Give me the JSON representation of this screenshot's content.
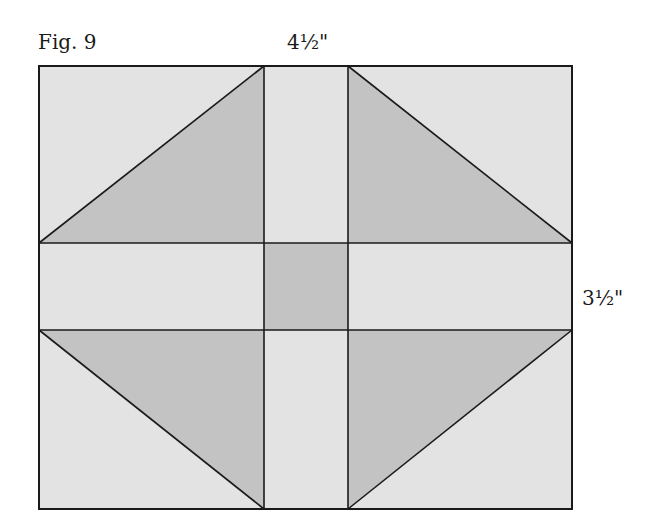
{
  "figure": {
    "label": "Fig. 9",
    "top_dimension": "4½\"",
    "side_dimension": "3½\""
  },
  "colors": {
    "light_fill": "#e3e3e3",
    "dark_fill": "#c3c3c3",
    "line": "#1a1a1a"
  },
  "block": {
    "outer": {
      "x1": 39,
      "y1": 66,
      "x2": 572,
      "y2": 509
    },
    "verticals": [
      264,
      348
    ],
    "horizontals": [
      243,
      330
    ],
    "pieces": [
      {
        "name": "top-left-corner",
        "triangle": "lower-right dark"
      },
      {
        "name": "top-center-bar",
        "fill": "light"
      },
      {
        "name": "top-right-corner",
        "triangle": "lower-left dark"
      },
      {
        "name": "middle-left-bar",
        "fill": "light"
      },
      {
        "name": "center-square",
        "fill": "dark"
      },
      {
        "name": "middle-right-bar",
        "fill": "light"
      },
      {
        "name": "bottom-left-corner",
        "triangle": "upper-right dark"
      },
      {
        "name": "bottom-center-bar",
        "fill": "light"
      },
      {
        "name": "bottom-right-corner",
        "triangle": "upper-left dark"
      }
    ]
  }
}
